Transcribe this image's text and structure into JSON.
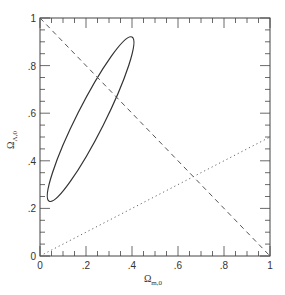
{
  "chart_data": {
    "type": "line",
    "title": "",
    "xlabel": "Ω",
    "xlabel_sub": "m,0",
    "ylabel": "Ω",
    "ylabel_sub": "Λ,0",
    "xlim": [
      0,
      1
    ],
    "ylim": [
      0,
      1
    ],
    "grid": false,
    "x_ticks": [
      0,
      0.2,
      0.4,
      0.6,
      0.8,
      1
    ],
    "x_tick_labels": [
      "0",
      ".2",
      ".4",
      ".6",
      ".8",
      "1"
    ],
    "y_ticks": [
      0,
      0.2,
      0.4,
      0.6,
      0.8,
      1
    ],
    "y_tick_labels": [
      "0",
      ".2",
      ".4",
      ".6",
      ".8",
      "1"
    ],
    "series": [
      {
        "name": "confidence-ellipse",
        "style": "solid",
        "shape": "ellipse",
        "center": [
          0.21,
          0.58
        ],
        "extent_points": {
          "top": [
            0.4,
            0.92
          ],
          "bottom": [
            0.04,
            0.23
          ],
          "left": [
            0.0,
            0.34
          ]
        }
      },
      {
        "name": "flat-universe",
        "style": "dashed",
        "x": [
          0,
          1
        ],
        "y": [
          1,
          0
        ]
      },
      {
        "name": "deceleration-zero",
        "style": "dotted",
        "x": [
          0,
          1
        ],
        "y": [
          0,
          0.5
        ]
      }
    ]
  }
}
